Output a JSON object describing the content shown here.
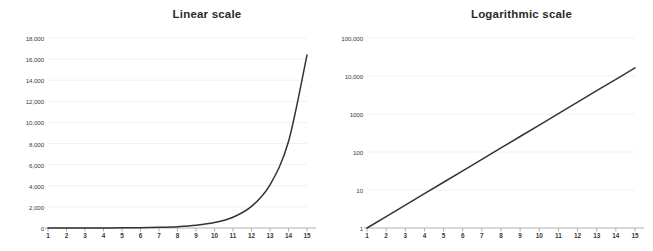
{
  "chart_data": [
    {
      "type": "line",
      "title": "Linear scale",
      "xlabel": "",
      "ylabel": "",
      "yscale": "linear",
      "grid": true,
      "legend": "none",
      "xlim": [
        1,
        15
      ],
      "ylim": [
        0,
        18000
      ],
      "x": [
        1,
        2,
        3,
        4,
        5,
        6,
        7,
        8,
        9,
        10,
        11,
        12,
        13,
        14,
        15
      ],
      "xticklabels": [
        "1",
        "2",
        "3",
        "4",
        "5",
        "6",
        "7",
        "8",
        "9",
        "10",
        "11",
        "12",
        "13",
        "14",
        "15"
      ],
      "yticklabels": [
        "0",
        "2,000",
        "4,000",
        "6,000",
        "8,000",
        "10,000",
        "12,000",
        "14,000",
        "16,000",
        "18,000"
      ],
      "yticks": [
        0,
        2000,
        4000,
        6000,
        8000,
        10000,
        12000,
        14000,
        16000,
        18000
      ],
      "values": [
        1,
        2,
        4,
        8,
        16,
        32,
        64,
        128,
        256,
        512,
        1024,
        2048,
        4096,
        8192,
        16384
      ]
    },
    {
      "type": "line",
      "title": "Logarithmic scale",
      "xlabel": "",
      "ylabel": "",
      "yscale": "log",
      "grid": true,
      "legend": "none",
      "xlim": [
        1,
        15
      ],
      "ylim": [
        1,
        100000
      ],
      "x": [
        1,
        2,
        3,
        4,
        5,
        6,
        7,
        8,
        9,
        10,
        11,
        12,
        13,
        14,
        15
      ],
      "xticklabels": [
        "1",
        "2",
        "3",
        "4",
        "5",
        "6",
        "7",
        "8",
        "9",
        "10",
        "11",
        "12",
        "13",
        "14",
        "15"
      ],
      "yticklabels": [
        "1",
        "10",
        "100",
        "1000",
        "10,000",
        "100,000"
      ],
      "yticks": [
        1,
        10,
        100,
        1000,
        10000,
        100000
      ],
      "values": [
        1,
        2,
        4,
        8,
        16,
        32,
        64,
        128,
        256,
        512,
        1024,
        2048,
        4096,
        8192,
        16384
      ]
    }
  ],
  "style": {
    "line_color": "#333333",
    "grid_color": "#f1f1f1",
    "axis_color": "#a6a6a6",
    "text_color": "#3a3a3a",
    "background": "#ffffff"
  }
}
